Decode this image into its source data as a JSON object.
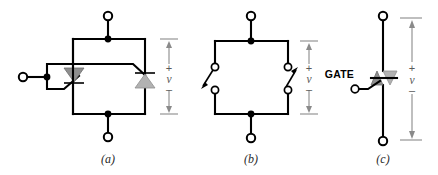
{
  "figure": {
    "background_color": "#ffffff",
    "wire_color": "#000000",
    "annotation_color": "#8a8a8a",
    "device_fill_dark": "#8e8e8e",
    "device_fill_light": "#b2b2b2"
  },
  "panels": [
    {
      "id": "a",
      "caption": "(a)",
      "description": "Two SCRs connected in inverse parallel with common gate",
      "terminals": [
        {
          "name": "top-terminal",
          "type": "open-circle"
        },
        {
          "name": "bottom-terminal",
          "type": "open-circle"
        },
        {
          "name": "gate-terminal",
          "type": "open-circle"
        }
      ],
      "devices": [
        {
          "name": "scr-left",
          "symbol": "thyristor",
          "direction": "down"
        },
        {
          "name": "scr-right",
          "symbol": "thyristor",
          "direction": "up"
        }
      ],
      "voltage": {
        "plus": "+",
        "symbol": "v",
        "minus": "–"
      }
    },
    {
      "id": "b",
      "caption": "(b)",
      "description": "Equivalent switch representation of the two SCRs",
      "terminals": [
        {
          "name": "top-terminal",
          "type": "open-circle"
        },
        {
          "name": "bottom-terminal",
          "type": "open-circle"
        }
      ],
      "devices": [
        {
          "name": "switch-left",
          "symbol": "switch",
          "direction": "down-left"
        },
        {
          "name": "switch-right",
          "symbol": "switch",
          "direction": "up-right"
        }
      ],
      "voltage": {
        "plus": "+",
        "symbol": "v",
        "minus": "–"
      }
    },
    {
      "id": "c",
      "caption": "(c)",
      "description": "TRIAC schematic symbol with gate terminal",
      "gate_label": "GATE",
      "terminals": [
        {
          "name": "top-terminal",
          "type": "open-circle"
        },
        {
          "name": "bottom-terminal",
          "type": "open-circle"
        },
        {
          "name": "gate-terminal",
          "type": "open-circle"
        }
      ],
      "devices": [
        {
          "name": "triac",
          "symbol": "triac",
          "direction": "bidirectional"
        }
      ],
      "voltage": {
        "plus": "+",
        "symbol": "v",
        "minus": "–"
      }
    }
  ]
}
